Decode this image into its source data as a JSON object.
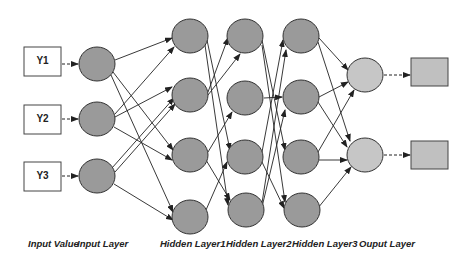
{
  "diagram": {
    "type": "neural-network",
    "colors": {
      "hidden_node_fill": "#9a9a9a",
      "output_node_fill": "#c6c6c6",
      "output_box_fill": "#c0c0c0",
      "stroke": "#333333"
    },
    "inputs": [
      {
        "id": "Y1",
        "label": "Y1"
      },
      {
        "id": "Y2",
        "label": "Y2"
      },
      {
        "id": "Y3",
        "label": "Y3"
      }
    ],
    "layer_labels": {
      "input_value": "Input Value",
      "input_layer": "Input Layer",
      "hidden1": "Hidden Layer1",
      "hidden2": "Hidden Layer2",
      "hidden3": "Hidden Layer3",
      "output": "Ouput Layer"
    },
    "layers": {
      "input": 3,
      "hidden1": 4,
      "hidden2": 4,
      "hidden3": 4,
      "output": 2
    },
    "connections": {
      "input_to_hidden1": [
        [
          1,
          1
        ],
        [
          1,
          3
        ],
        [
          1,
          4
        ],
        [
          2,
          1
        ],
        [
          2,
          2
        ],
        [
          2,
          3
        ],
        [
          3,
          2
        ],
        [
          3,
          2
        ],
        [
          3,
          4
        ]
      ],
      "hidden1_to_hidden2": [
        [
          1,
          3
        ],
        [
          1,
          4
        ],
        [
          2,
          1
        ],
        [
          2,
          1
        ],
        [
          3,
          2
        ],
        [
          3,
          4
        ],
        [
          4,
          3
        ]
      ],
      "hidden2_to_hidden3": [
        [
          1,
          3
        ],
        [
          1,
          4
        ],
        [
          2,
          2
        ],
        [
          3,
          1
        ],
        [
          3,
          4
        ],
        [
          4,
          1
        ],
        [
          4,
          2
        ]
      ],
      "hidden3_to_output": [
        [
          1,
          1
        ],
        [
          1,
          2
        ],
        [
          2,
          1
        ],
        [
          2,
          2
        ],
        [
          3,
          1
        ],
        [
          3,
          2
        ],
        [
          4,
          2
        ]
      ]
    }
  }
}
